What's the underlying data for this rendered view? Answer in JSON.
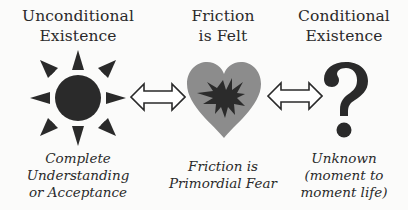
{
  "columns": [
    {
      "id": "unconditional",
      "title_lines": [
        "Unconditional",
        "Existence"
      ],
      "icon": "sun-icon",
      "caption_lines": [
        "Complete",
        "Understanding",
        "or Acceptance"
      ]
    },
    {
      "id": "friction",
      "title_lines": [
        "Friction",
        "is Felt"
      ],
      "icon": "heart-with-starburst-icon",
      "caption_lines": [
        "Friction is",
        "Primordial Fear"
      ]
    },
    {
      "id": "conditional",
      "title_lines": [
        "Conditional",
        "Existence"
      ],
      "icon": "question-mark-icon",
      "caption_lines": [
        "Unknown",
        "(moment to",
        "moment life)"
      ]
    }
  ],
  "connectors": [
    {
      "from": "unconditional",
      "to": "friction",
      "icon": "double-arrow-icon"
    },
    {
      "from": "friction",
      "to": "conditional",
      "icon": "double-arrow-icon"
    }
  ],
  "colors": {
    "background": "#fbfbfa",
    "ink": "#2a2a2a",
    "heart": "#8c8c8c",
    "starburst": "#2b2b2b"
  }
}
